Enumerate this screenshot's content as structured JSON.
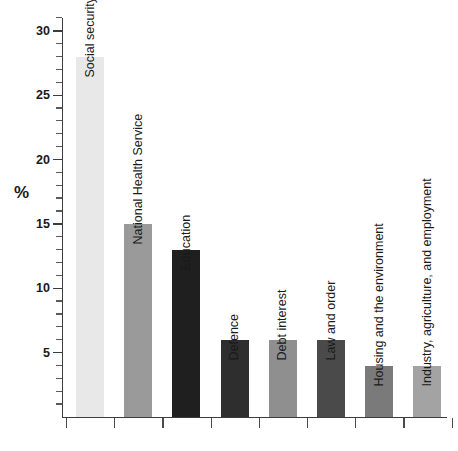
{
  "chart_data": {
    "type": "bar",
    "title": "",
    "xlabel": "",
    "ylabel": "%",
    "ylim": [
      0,
      31
    ],
    "grid": false,
    "legend": "none",
    "y_major_ticks": [
      5,
      10,
      15,
      20,
      25,
      30
    ],
    "y_minor_tick_step": 1,
    "y_tick_labels": [
      "5",
      "10",
      "15",
      "20",
      "25",
      "30"
    ],
    "categories": [
      "Social security",
      "National Health Service",
      "Education",
      "Defence",
      "Debt interest",
      "Law and order",
      "Housing and the environment",
      "Industry, agriculture, and employment"
    ],
    "values": [
      28,
      15,
      13,
      6,
      6,
      6,
      4,
      4
    ],
    "bar_colors": [
      "#e8e8e8",
      "#9a9a9a",
      "#1f1f1f",
      "#2e2e2e",
      "#8f8f8f",
      "#4a4a4a",
      "#7a7a7a",
      "#a3a3a3"
    ],
    "axis_color": "#3c3c3c",
    "label_color": "#1a1a1a",
    "background": "#ffffff"
  },
  "axis": {
    "y_label": "%"
  }
}
